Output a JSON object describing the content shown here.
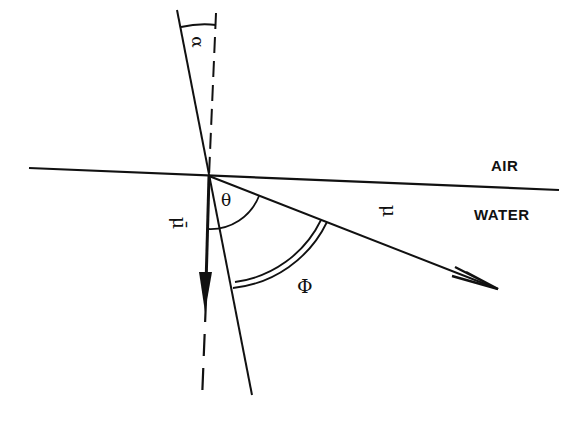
{
  "diagram": {
    "type": "refraction-geometry",
    "media": {
      "upper_label": "AIR",
      "lower_label": "WATER"
    },
    "angles": {
      "alpha": "α",
      "theta": "θ",
      "phi": "Φ"
    },
    "vectors": {
      "mu": "μ",
      "mu_bar": "μ̄"
    },
    "colors": {
      "ink": "#111111",
      "background": "#ffffff"
    }
  }
}
